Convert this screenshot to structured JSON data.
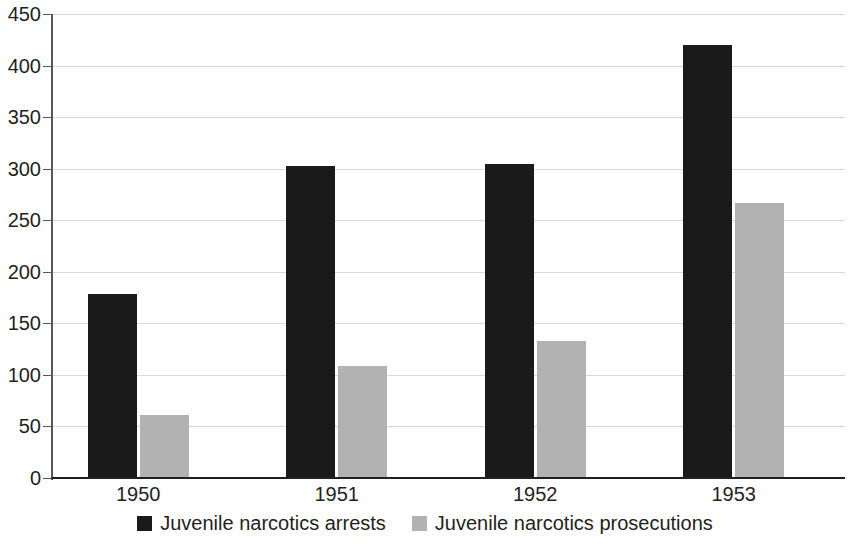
{
  "chart_data": {
    "type": "bar",
    "title": "",
    "subtitle": "",
    "xlabel": "",
    "ylabel": "",
    "categories": [
      "1950",
      "1951",
      "1952",
      "1953"
    ],
    "series": [
      {
        "name": "Juvenile narcotics arrests",
        "color": "#1a1a1a",
        "values": [
          178,
          303,
          305,
          420
        ]
      },
      {
        "name": "Juvenile narcotics prosecutions",
        "color": "#b2b2b2",
        "values": [
          61,
          109,
          133,
          267
        ]
      }
    ],
    "ylim": [
      0,
      450
    ],
    "ytick_step": 50,
    "yticks": [
      0,
      50,
      100,
      150,
      200,
      250,
      300,
      350,
      400,
      450
    ],
    "ytick_labels": [
      "0",
      "50",
      "100",
      "150",
      "200",
      "250",
      "300",
      "350",
      "400",
      "450"
    ],
    "grid": true,
    "grid_axis": "y",
    "legend_position": "bottom",
    "background_color": "#ffffff",
    "axis_color": "#231f20",
    "gridline_color": "#d9d9dd"
  }
}
